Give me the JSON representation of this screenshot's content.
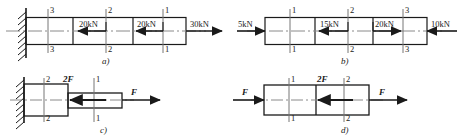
{
  "figure": {
    "background": "#ffffff",
    "line_color": "#1a1a1a"
  },
  "panels": [
    {
      "id": "a",
      "caption": "a)",
      "support": "fixed-wall-left",
      "sections": [
        "3",
        "2",
        "1"
      ],
      "loads": [
        {
          "label": "20kN",
          "direction": "left"
        },
        {
          "label": "20kN",
          "direction": "left"
        },
        {
          "label": "30kN",
          "direction": "right"
        }
      ]
    },
    {
      "id": "b",
      "caption": "b)",
      "support": "none",
      "sections": [
        "1",
        "2",
        "3"
      ],
      "loads": [
        {
          "label": "5kN",
          "direction": "right"
        },
        {
          "label": "15kN",
          "direction": "left"
        },
        {
          "label": "20kN",
          "direction": "right"
        },
        {
          "label": "10kN",
          "direction": "left"
        }
      ]
    },
    {
      "id": "c",
      "caption": "c)",
      "support": "fixed-wall-left",
      "sections": [
        "2",
        "1"
      ],
      "loads": [
        {
          "label": "2F",
          "direction": "left"
        },
        {
          "label": "F",
          "direction": "right"
        }
      ]
    },
    {
      "id": "d",
      "caption": "d)",
      "support": "none",
      "sections": [
        "1",
        "2"
      ],
      "loads": [
        {
          "label": "F",
          "direction": "right"
        },
        {
          "label": "2F",
          "direction": "left"
        },
        {
          "label": "F",
          "direction": "right"
        }
      ]
    }
  ],
  "labels": {
    "a_sec_top_3": "3",
    "a_sec_bot_3": "3",
    "a_sec_top_2": "2",
    "a_sec_bot_2": "2",
    "a_sec_top_1": "1",
    "a_sec_bot_1": "1",
    "a_load_1": "20kN",
    "a_load_2": "20kN",
    "a_load_3": "30kN",
    "a_caption": "a)",
    "b_sec_top_1": "1",
    "b_sec_bot_1": "1",
    "b_sec_top_2": "2",
    "b_sec_bot_2": "2",
    "b_sec_top_3": "3",
    "b_sec_bot_3": "3",
    "b_load_1": "5kN",
    "b_load_2": "15kN",
    "b_load_3": "20kN",
    "b_load_4": "10kN",
    "b_caption": "b)",
    "c_sec_top_2": "2",
    "c_sec_bot_2": "2",
    "c_sec_top_1": "1",
    "c_sec_bot_1": "1",
    "c_load_1": "2F",
    "c_load_2": "F",
    "c_caption": "c)",
    "d_sec_top_1": "1",
    "d_sec_bot_1": "1",
    "d_sec_top_2": "2",
    "d_sec_bot_2": "2",
    "d_load_1": "F",
    "d_load_2": "2F",
    "d_load_3": "F",
    "d_caption": "d)"
  }
}
